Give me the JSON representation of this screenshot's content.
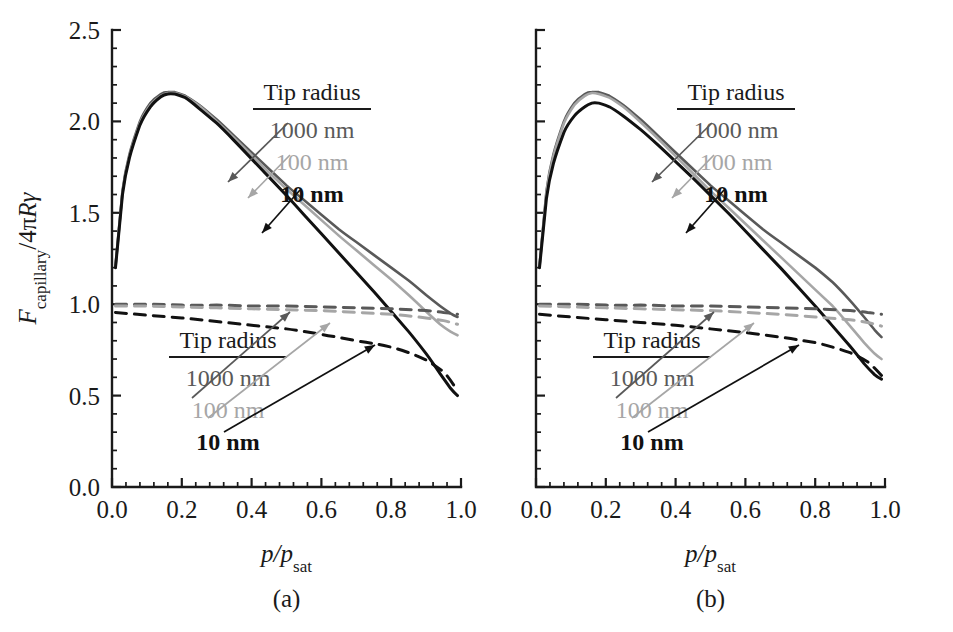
{
  "figure": {
    "panels": [
      {
        "id": "a",
        "label": "(a)",
        "xlabel_main": "p/p",
        "xlabel_sub": "sat",
        "ylabel_main_f": "F",
        "ylabel_main_sub": "capillary",
        "ylabel_rest": "/4πRγ",
        "legend_solid": {
          "title": "Tip radius",
          "entries": [
            "1000 nm",
            "100 nm",
            "10 nm"
          ]
        },
        "legend_dashed": {
          "title": "Tip radius",
          "entries": [
            "1000 nm",
            "100 nm",
            "10 nm"
          ]
        }
      },
      {
        "id": "b",
        "label": "(b)",
        "xlabel_main": "p/p",
        "xlabel_sub": "sat",
        "legend_solid": {
          "title": "Tip radius",
          "entries": [
            "1000 nm",
            "100 nm",
            "10 nm"
          ]
        },
        "legend_dashed": {
          "title": "Tip radius",
          "entries": [
            "1000 nm",
            "100 nm",
            "10 nm"
          ]
        }
      }
    ],
    "colors": {
      "r1000": "#595959",
      "r100": "#a6a6a6",
      "r10": "#111111",
      "axis": "#1a1a1a",
      "background": "#ffffff"
    }
  },
  "chart_data": [
    {
      "type": "line",
      "panel": "a",
      "title": "",
      "xlabel": "p/p_sat",
      "ylabel": "F_capillary / 4πRγ",
      "xlim": [
        0.0,
        1.0
      ],
      "ylim": [
        0.0,
        2.5
      ],
      "xticks": [
        "0.0",
        "0.2",
        "0.4",
        "0.6",
        "0.8",
        "1.0"
      ],
      "yticks": [
        "0.0",
        "0.5",
        "1.0",
        "1.5",
        "2.0",
        "2.5"
      ],
      "xtick_values": [
        0.0,
        0.2,
        0.4,
        0.6,
        0.8,
        1.0
      ],
      "ytick_values": [
        0.0,
        0.5,
        1.0,
        1.5,
        2.0,
        2.5
      ],
      "minor_ticks_per_interval": 4,
      "grid": false,
      "legend_position": "upper-right-inside",
      "series": [
        {
          "name": "1000 nm",
          "style": "solid",
          "color": "#595959",
          "x": [
            0.01,
            0.03,
            0.05,
            0.08,
            0.11,
            0.14,
            0.16,
            0.18,
            0.21,
            0.25,
            0.3,
            0.35,
            0.4,
            0.45,
            0.5,
            0.55,
            0.6,
            0.65,
            0.7,
            0.75,
            0.8,
            0.85,
            0.9,
            0.94,
            0.97,
            0.99
          ],
          "y": [
            1.21,
            1.62,
            1.82,
            2.0,
            2.1,
            2.15,
            2.16,
            2.16,
            2.14,
            2.09,
            2.01,
            1.92,
            1.83,
            1.74,
            1.65,
            1.57,
            1.49,
            1.41,
            1.34,
            1.27,
            1.2,
            1.13,
            1.05,
            0.99,
            0.95,
            0.93
          ]
        },
        {
          "name": "100 nm",
          "style": "solid",
          "color": "#a6a6a6",
          "x": [
            0.01,
            0.03,
            0.05,
            0.08,
            0.11,
            0.14,
            0.16,
            0.18,
            0.21,
            0.25,
            0.3,
            0.35,
            0.4,
            0.45,
            0.5,
            0.55,
            0.6,
            0.65,
            0.7,
            0.75,
            0.8,
            0.85,
            0.9,
            0.94,
            0.97,
            0.99
          ],
          "y": [
            1.2,
            1.61,
            1.81,
            1.99,
            2.09,
            2.14,
            2.155,
            2.155,
            2.135,
            2.085,
            2.0,
            1.91,
            1.815,
            1.72,
            1.63,
            1.545,
            1.46,
            1.375,
            1.295,
            1.215,
            1.135,
            1.05,
            0.96,
            0.89,
            0.85,
            0.83
          ]
        },
        {
          "name": "10 nm",
          "style": "solid",
          "color": "#111111",
          "x": [
            0.01,
            0.03,
            0.05,
            0.08,
            0.11,
            0.14,
            0.16,
            0.18,
            0.21,
            0.25,
            0.3,
            0.35,
            0.4,
            0.45,
            0.5,
            0.55,
            0.6,
            0.65,
            0.7,
            0.75,
            0.8,
            0.85,
            0.9,
            0.94,
            0.97,
            0.99
          ],
          "y": [
            1.2,
            1.6,
            1.8,
            1.98,
            2.08,
            2.135,
            2.15,
            2.15,
            2.13,
            2.07,
            1.99,
            1.895,
            1.795,
            1.695,
            1.595,
            1.49,
            1.385,
            1.28,
            1.175,
            1.07,
            0.96,
            0.85,
            0.73,
            0.62,
            0.54,
            0.5
          ]
        },
        {
          "name": "1000 nm",
          "style": "dashed",
          "color": "#595959",
          "x": [
            0.01,
            0.1,
            0.2,
            0.3,
            0.4,
            0.5,
            0.6,
            0.7,
            0.8,
            0.9,
            0.95,
            0.99
          ],
          "y": [
            1.0,
            1.0,
            0.995,
            0.995,
            0.99,
            0.99,
            0.985,
            0.98,
            0.975,
            0.965,
            0.955,
            0.945
          ]
        },
        {
          "name": "100 nm",
          "style": "dashed",
          "color": "#a6a6a6",
          "x": [
            0.01,
            0.1,
            0.2,
            0.3,
            0.4,
            0.5,
            0.6,
            0.7,
            0.8,
            0.9,
            0.95,
            0.99
          ],
          "y": [
            0.99,
            0.99,
            0.985,
            0.98,
            0.975,
            0.97,
            0.965,
            0.955,
            0.945,
            0.925,
            0.91,
            0.89
          ]
        },
        {
          "name": "10 nm",
          "style": "dashed",
          "color": "#111111",
          "x": [
            0.01,
            0.1,
            0.2,
            0.3,
            0.4,
            0.5,
            0.6,
            0.7,
            0.75,
            0.8,
            0.85,
            0.9,
            0.95,
            0.99
          ],
          "y": [
            0.955,
            0.94,
            0.925,
            0.905,
            0.885,
            0.865,
            0.835,
            0.8,
            0.785,
            0.765,
            0.735,
            0.695,
            0.63,
            0.525
          ]
        }
      ]
    },
    {
      "type": "line",
      "panel": "b",
      "title": "",
      "xlabel": "p/p_sat",
      "ylabel": "F_capillary / 4πRγ",
      "xlim": [
        0.0,
        1.0
      ],
      "ylim": [
        0.0,
        2.5
      ],
      "xticks": [
        "0.0",
        "0.2",
        "0.4",
        "0.6",
        "0.8",
        "1.0"
      ],
      "yticks": [
        "0.0",
        "0.5",
        "1.0",
        "1.5",
        "2.0",
        "2.5"
      ],
      "xtick_values": [
        0.0,
        0.2,
        0.4,
        0.6,
        0.8,
        1.0
      ],
      "ytick_values": [
        0.0,
        0.5,
        1.0,
        1.5,
        2.0,
        2.5
      ],
      "minor_ticks_per_interval": 4,
      "grid": false,
      "legend_position": "upper-right-inside",
      "series": [
        {
          "name": "1000 nm",
          "style": "solid",
          "color": "#595959",
          "x": [
            0.01,
            0.03,
            0.05,
            0.08,
            0.11,
            0.14,
            0.16,
            0.18,
            0.21,
            0.25,
            0.3,
            0.35,
            0.4,
            0.45,
            0.5,
            0.55,
            0.6,
            0.65,
            0.7,
            0.75,
            0.8,
            0.85,
            0.9,
            0.94,
            0.97,
            0.99
          ],
          "y": [
            1.21,
            1.62,
            1.82,
            2.0,
            2.1,
            2.15,
            2.16,
            2.16,
            2.14,
            2.09,
            2.01,
            1.92,
            1.83,
            1.74,
            1.65,
            1.57,
            1.49,
            1.41,
            1.34,
            1.27,
            1.2,
            1.12,
            1.02,
            0.93,
            0.86,
            0.82
          ]
        },
        {
          "name": "100 nm",
          "style": "solid",
          "color": "#a6a6a6",
          "x": [
            0.01,
            0.03,
            0.05,
            0.08,
            0.11,
            0.14,
            0.16,
            0.18,
            0.21,
            0.25,
            0.3,
            0.35,
            0.4,
            0.45,
            0.5,
            0.55,
            0.6,
            0.65,
            0.7,
            0.75,
            0.8,
            0.85,
            0.9,
            0.94,
            0.97,
            0.99
          ],
          "y": [
            1.2,
            1.61,
            1.81,
            1.99,
            2.09,
            2.14,
            2.155,
            2.15,
            2.13,
            2.08,
            1.995,
            1.905,
            1.81,
            1.715,
            1.62,
            1.53,
            1.44,
            1.35,
            1.26,
            1.17,
            1.08,
            0.99,
            0.88,
            0.79,
            0.73,
            0.7
          ]
        },
        {
          "name": "10 nm",
          "style": "solid",
          "color": "#111111",
          "x": [
            0.01,
            0.03,
            0.05,
            0.08,
            0.11,
            0.14,
            0.16,
            0.18,
            0.21,
            0.25,
            0.3,
            0.35,
            0.4,
            0.45,
            0.5,
            0.55,
            0.6,
            0.65,
            0.7,
            0.75,
            0.8,
            0.85,
            0.9,
            0.94,
            0.97,
            0.99
          ],
          "y": [
            1.2,
            1.58,
            1.77,
            1.94,
            2.03,
            2.08,
            2.1,
            2.1,
            2.08,
            2.03,
            1.955,
            1.87,
            1.78,
            1.69,
            1.595,
            1.5,
            1.4,
            1.3,
            1.2,
            1.095,
            0.99,
            0.88,
            0.77,
            0.675,
            0.615,
            0.59
          ]
        },
        {
          "name": "1000 nm",
          "style": "dashed",
          "color": "#595959",
          "x": [
            0.01,
            0.1,
            0.2,
            0.3,
            0.4,
            0.5,
            0.6,
            0.7,
            0.8,
            0.9,
            0.95,
            0.99
          ],
          "y": [
            1.0,
            1.0,
            0.995,
            0.995,
            0.99,
            0.99,
            0.985,
            0.98,
            0.975,
            0.965,
            0.955,
            0.945
          ]
        },
        {
          "name": "100 nm",
          "style": "dashed",
          "color": "#a6a6a6",
          "x": [
            0.01,
            0.1,
            0.2,
            0.3,
            0.4,
            0.5,
            0.6,
            0.7,
            0.8,
            0.9,
            0.95,
            0.99
          ],
          "y": [
            0.99,
            0.985,
            0.98,
            0.975,
            0.97,
            0.965,
            0.955,
            0.945,
            0.93,
            0.915,
            0.9,
            0.88
          ]
        },
        {
          "name": "10 nm",
          "style": "dashed",
          "color": "#111111",
          "x": [
            0.01,
            0.1,
            0.2,
            0.3,
            0.4,
            0.5,
            0.6,
            0.7,
            0.75,
            0.8,
            0.85,
            0.9,
            0.95,
            0.99
          ],
          "y": [
            0.945,
            0.93,
            0.915,
            0.9,
            0.885,
            0.865,
            0.845,
            0.82,
            0.805,
            0.79,
            0.765,
            0.735,
            0.685,
            0.61
          ]
        }
      ]
    }
  ]
}
